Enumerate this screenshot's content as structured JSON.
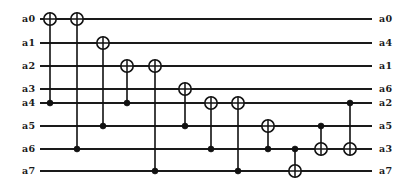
{
  "figure": {
    "kind": "quantum-circuit-diagram",
    "width": 404,
    "height": 189,
    "background_color": "#ffffff",
    "line_color": "#1a1a1a"
  },
  "chart_data": {
    "type": "diagram",
    "title": "",
    "wire_count": 8,
    "gate_count": 12,
    "wires": [
      {
        "index": 0,
        "input_label": "a0",
        "output_label": "a0",
        "y": 19
      },
      {
        "index": 1,
        "input_label": "a1",
        "output_label": "a4",
        "y": 43
      },
      {
        "index": 2,
        "input_label": "a2",
        "output_label": "a1",
        "y": 66
      },
      {
        "index": 3,
        "input_label": "a3",
        "output_label": "a6",
        "y": 89
      },
      {
        "index": 4,
        "input_label": "a4",
        "output_label": "a2",
        "y": 103
      },
      {
        "index": 5,
        "input_label": "a5",
        "output_label": "a5",
        "y": 126
      },
      {
        "index": 6,
        "input_label": "a6",
        "output_label": "a3",
        "y": 149
      },
      {
        "index": 7,
        "input_label": "a7",
        "output_label": "a7",
        "y": 171
      }
    ],
    "wire_x_start": 40,
    "wire_x_end": 372,
    "gates": [
      {
        "id": 1,
        "type": "cnot",
        "x": 50,
        "target_wire": 0,
        "control_wire": 4
      },
      {
        "id": 2,
        "type": "cnot",
        "x": 77,
        "target_wire": 0,
        "control_wire": 6
      },
      {
        "id": 3,
        "type": "cnot",
        "x": 103,
        "target_wire": 1,
        "control_wire": 5
      },
      {
        "id": 4,
        "type": "cnot",
        "x": 127,
        "target_wire": 2,
        "control_wire": 4
      },
      {
        "id": 5,
        "type": "cnot",
        "x": 155,
        "target_wire": 2,
        "control_wire": 7
      },
      {
        "id": 6,
        "type": "cnot",
        "x": 185,
        "target_wire": 3,
        "control_wire": 5
      },
      {
        "id": 7,
        "type": "cnot",
        "x": 211,
        "target_wire": 4,
        "control_wire": 6
      },
      {
        "id": 8,
        "type": "cnot",
        "x": 238,
        "target_wire": 4,
        "control_wire": 7
      },
      {
        "id": 9,
        "type": "cnot",
        "x": 268,
        "target_wire": 5,
        "control_wire": 6
      },
      {
        "id": 10,
        "type": "cnot",
        "x": 295,
        "target_wire": 7,
        "control_wire": 6
      },
      {
        "id": 11,
        "type": "cnot",
        "x": 321,
        "target_wire": 6,
        "control_wire": 5
      },
      {
        "id": 12,
        "type": "cnot",
        "x": 350,
        "target_wire": 6,
        "control_wire": 4
      }
    ],
    "target_radius": 6.2,
    "control_radius": 3.0
  }
}
